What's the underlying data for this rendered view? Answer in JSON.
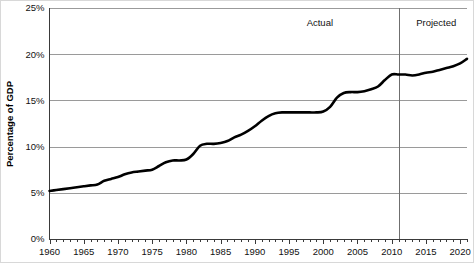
{
  "chart_data": {
    "type": "line",
    "title": "",
    "xlabel": "",
    "ylabel": "Percentage of GDP",
    "xlim": [
      1960,
      2021
    ],
    "ylim": [
      0,
      25
    ],
    "grid": true,
    "legend_position": "none",
    "y_tick_labels": [
      "0%",
      "5%",
      "10%",
      "15%",
      "20%",
      "25%"
    ],
    "y_tick_values": [
      0,
      5,
      10,
      15,
      20,
      25
    ],
    "x_tick_labels": [
      "1960",
      "1965",
      "1970",
      "1975",
      "1980",
      "1985",
      "1990",
      "1995",
      "2000",
      "2005",
      "2010",
      "2015",
      "2020"
    ],
    "x_tick_values": [
      1960,
      1965,
      1970,
      1975,
      1980,
      1985,
      1990,
      1995,
      2000,
      2005,
      2010,
      2015,
      2020
    ],
    "x_minor_tick_interval": 1,
    "annotations": [
      {
        "name": "actual-label",
        "text": "Actual",
        "x": 1999.5,
        "y": 23.0
      },
      {
        "name": "projected-label",
        "text": "Projected",
        "x": 2016.5,
        "y": 23.0
      }
    ],
    "divider": {
      "x": 2011,
      "label_left": "Actual",
      "label_right": "Projected"
    },
    "series": [
      {
        "name": "Percentage of GDP",
        "color": "#000000",
        "x": [
          1960,
          1961,
          1962,
          1963,
          1964,
          1965,
          1966,
          1967,
          1968,
          1969,
          1970,
          1971,
          1972,
          1973,
          1974,
          1975,
          1976,
          1977,
          1978,
          1979,
          1980,
          1981,
          1982,
          1983,
          1984,
          1985,
          1986,
          1987,
          1988,
          1989,
          1990,
          1991,
          1992,
          1993,
          1994,
          1995,
          1996,
          1997,
          1998,
          1999,
          2000,
          2001,
          2002,
          2003,
          2004,
          2005,
          2006,
          2007,
          2008,
          2009,
          2010,
          2011,
          2012,
          2013,
          2014,
          2015,
          2016,
          2017,
          2018,
          2019,
          2020,
          2021
        ],
        "values": [
          5.2,
          5.3,
          5.4,
          5.5,
          5.6,
          5.7,
          5.8,
          5.9,
          6.3,
          6.5,
          6.7,
          7.0,
          7.2,
          7.3,
          7.4,
          7.5,
          7.9,
          8.3,
          8.5,
          8.5,
          8.6,
          9.2,
          10.1,
          10.3,
          10.3,
          10.4,
          10.6,
          11.0,
          11.3,
          11.7,
          12.2,
          12.8,
          13.3,
          13.6,
          13.7,
          13.7,
          13.7,
          13.7,
          13.7,
          13.7,
          13.8,
          14.3,
          15.3,
          15.8,
          15.9,
          15.9,
          16.0,
          16.2,
          16.5,
          17.2,
          17.8,
          17.8,
          17.8,
          17.7,
          17.8,
          18.0,
          18.1,
          18.3,
          18.5,
          18.7,
          19.0,
          19.5
        ],
        "units": "percent of GDP"
      }
    ]
  }
}
